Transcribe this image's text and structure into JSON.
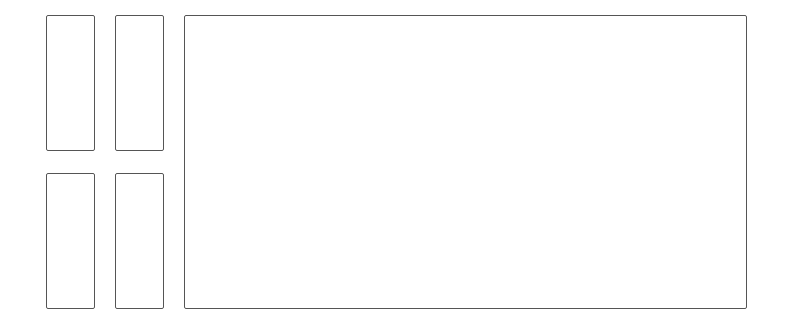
{
  "diagram": {
    "stroke_color": "#555555",
    "background": "#ffffff",
    "small_panels": [
      {
        "id": "top-left",
        "x": 46,
        "y": 15,
        "w": 49,
        "h": 136
      },
      {
        "id": "top-right",
        "x": 115,
        "y": 15,
        "w": 49,
        "h": 136
      },
      {
        "id": "bottom-left",
        "x": 46,
        "y": 173,
        "w": 49,
        "h": 136
      },
      {
        "id": "bottom-right",
        "x": 115,
        "y": 173,
        "w": 49,
        "h": 136
      }
    ],
    "main_panel": {
      "id": "main",
      "x": 184,
      "y": 15,
      "w": 563,
      "h": 294
    }
  }
}
